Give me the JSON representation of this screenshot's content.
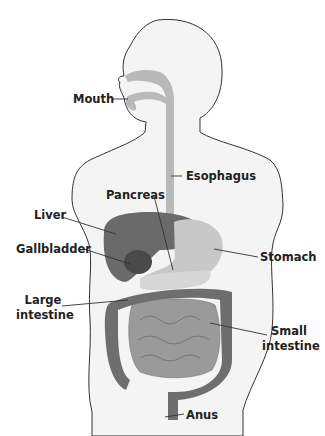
{
  "diagram": {
    "labels": {
      "mouth": "Mouth",
      "esophagus": "Esophagus",
      "pancreas": "Pancreas",
      "liver": "Liver",
      "gallbladder": "Gallbladder",
      "stomach": "Stomach",
      "large_intestine_1": "Large",
      "large_intestine_2": "intestine",
      "small_intestine_1": "Small",
      "small_intestine_2": "intestine",
      "anus": "Anus"
    },
    "colors": {
      "body_fill": "#f4f4f4",
      "outline": "#333333",
      "tract": "#b9b9b9",
      "liver": "#6a6a6a",
      "gallbladder": "#4a4a4a",
      "stomach": "#c8c8c8",
      "small_intestine": "#9a9a9a",
      "large_intestine": "#6e6e6e",
      "pancreas": "#d6d6d6"
    }
  }
}
